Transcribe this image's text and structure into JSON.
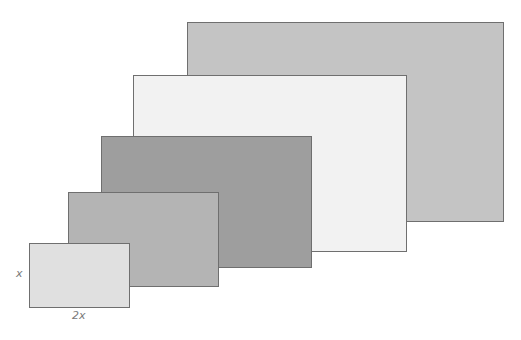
{
  "diagram": {
    "labels": {
      "height": "x",
      "width": "2x"
    },
    "rectangles": [
      {
        "name": "largest",
        "x": 187,
        "y": 22,
        "w": 316,
        "h": 199,
        "fill": "#c4c4c4"
      },
      {
        "name": "second",
        "x": 133,
        "y": 75,
        "w": 273,
        "h": 176,
        "fill": "#f2f2f2"
      },
      {
        "name": "third",
        "x": 101,
        "y": 136,
        "w": 210,
        "h": 131,
        "fill": "#9e9e9e"
      },
      {
        "name": "fourth",
        "x": 68,
        "y": 192,
        "w": 150,
        "h": 94,
        "fill": "#b4b4b4"
      },
      {
        "name": "smallest",
        "x": 29,
        "y": 243,
        "w": 100,
        "h": 64,
        "fill": "#e0e0e0"
      }
    ]
  }
}
